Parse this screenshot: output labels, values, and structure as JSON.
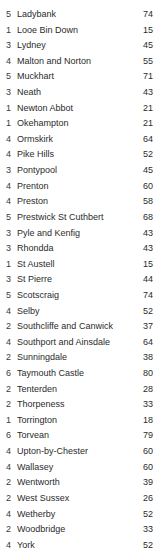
{
  "table": {
    "columns": [
      "index",
      "name",
      "value"
    ],
    "rows": [
      {
        "index": "5",
        "name": "Ladybank",
        "value": "74"
      },
      {
        "index": "1",
        "name": "Looe Bin Down",
        "value": "15"
      },
      {
        "index": "3",
        "name": "Lydney",
        "value": "45"
      },
      {
        "index": "4",
        "name": "Malton and Norton",
        "value": "55"
      },
      {
        "index": "5",
        "name": "Muckhart",
        "value": "71"
      },
      {
        "index": "3",
        "name": "Neath",
        "value": "43"
      },
      {
        "index": "1",
        "name": "Newton Abbot",
        "value": "21"
      },
      {
        "index": "1",
        "name": "Okehampton",
        "value": "21"
      },
      {
        "index": "4",
        "name": "Ormskirk",
        "value": "64"
      },
      {
        "index": "4",
        "name": "Pike Hills",
        "value": "52"
      },
      {
        "index": "3",
        "name": "Pontypool",
        "value": "45"
      },
      {
        "index": "4",
        "name": "Prenton",
        "value": "60"
      },
      {
        "index": "4",
        "name": "Preston",
        "value": "58"
      },
      {
        "index": "5",
        "name": "Prestwick St Cuthbert",
        "value": "68"
      },
      {
        "index": "3",
        "name": "Pyle and Kenfig",
        "value": "43"
      },
      {
        "index": "3",
        "name": "Rhondda",
        "value": "43"
      },
      {
        "index": "1",
        "name": "St Austell",
        "value": "15"
      },
      {
        "index": "3",
        "name": "St Pierre",
        "value": "44"
      },
      {
        "index": "5",
        "name": "Scotscraig",
        "value": "74"
      },
      {
        "index": "4",
        "name": "Selby",
        "value": "52"
      },
      {
        "index": "2",
        "name": "Southcliffe and Canwick",
        "value": "37"
      },
      {
        "index": "4",
        "name": "Southport and Ainsdale",
        "value": "64"
      },
      {
        "index": "2",
        "name": "Sunningdale",
        "value": "38"
      },
      {
        "index": "6",
        "name": "Taymouth Castle",
        "value": "80"
      },
      {
        "index": "2",
        "name": "Tenterden",
        "value": "28"
      },
      {
        "index": "2",
        "name": "Thorpeness",
        "value": "33"
      },
      {
        "index": "1",
        "name": "Torrington",
        "value": "18"
      },
      {
        "index": "6",
        "name": "Torvean",
        "value": "79"
      },
      {
        "index": "4",
        "name": "Upton-by-Chester",
        "value": "60"
      },
      {
        "index": "4",
        "name": "Wallasey",
        "value": "60"
      },
      {
        "index": "2",
        "name": "Wentworth",
        "value": "39"
      },
      {
        "index": "2",
        "name": "West Sussex",
        "value": "26"
      },
      {
        "index": "4",
        "name": "Wetherby",
        "value": "52"
      },
      {
        "index": "2",
        "name": "Woodbridge",
        "value": "33"
      },
      {
        "index": "4",
        "name": "York",
        "value": "52"
      }
    ]
  }
}
